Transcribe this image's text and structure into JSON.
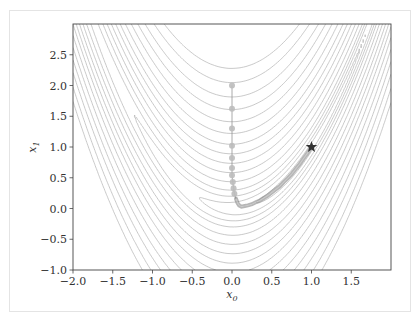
{
  "chart_data": {
    "type": "contour",
    "title": "",
    "function": "Rosenbrock f(x0,x1) = (1 - x0)^2 + 100 (x1 - x0^2)^2",
    "xlabel": "x0",
    "ylabel": "x1",
    "xlim": [
      -2.0,
      2.0
    ],
    "ylim": [
      -1.0,
      3.0
    ],
    "grid": false,
    "x_ticks": [
      "-2.0",
      "-1.5",
      "-1.0",
      "-0.5",
      "0.0",
      "0.5",
      "1.0",
      "1.5"
    ],
    "x_tick_values": [
      -2.0,
      -1.5,
      -1.0,
      -0.5,
      0.0,
      0.5,
      1.0,
      1.5
    ],
    "y_ticks": [
      "-1.0",
      "-0.5",
      "0.0",
      "0.5",
      "1.0",
      "1.5",
      "2.0",
      "2.5"
    ],
    "y_tick_values": [
      -1.0,
      -0.5,
      0.0,
      0.5,
      1.0,
      1.5,
      2.0,
      2.5
    ],
    "contour_levels": [
      0.5,
      2,
      5,
      10,
      20,
      35,
      55,
      80,
      110,
      150,
      200,
      260,
      330,
      420,
      520
    ],
    "optimization_path": {
      "start": [
        0.0,
        2.0
      ],
      "points": [
        [
          0.0,
          2.0
        ],
        [
          0.0,
          1.62
        ],
        [
          0.0,
          1.3
        ],
        [
          0.0,
          1.02
        ],
        [
          0.0,
          0.82
        ],
        [
          0.0,
          0.66
        ],
        [
          0.0,
          0.54
        ],
        [
          0.01,
          0.43
        ],
        [
          0.02,
          0.33
        ],
        [
          0.03,
          0.24
        ],
        [
          0.05,
          0.16
        ],
        [
          0.07,
          0.09
        ],
        [
          0.09,
          0.05
        ],
        [
          0.12,
          0.03
        ],
        [
          0.16,
          0.04
        ],
        [
          0.2,
          0.05
        ],
        [
          0.25,
          0.07
        ],
        [
          0.3,
          0.1
        ],
        [
          0.35,
          0.13
        ],
        [
          0.4,
          0.17
        ],
        [
          0.45,
          0.21
        ],
        [
          0.5,
          0.26
        ],
        [
          0.55,
          0.31
        ],
        [
          0.6,
          0.36
        ],
        [
          0.65,
          0.43
        ],
        [
          0.7,
          0.49
        ],
        [
          0.75,
          0.56
        ],
        [
          0.8,
          0.64
        ],
        [
          0.85,
          0.72
        ],
        [
          0.9,
          0.81
        ],
        [
          0.95,
          0.9
        ],
        [
          1.0,
          1.0
        ]
      ]
    },
    "minimum_marker": {
      "x": 1.0,
      "y": 1.0,
      "symbol": "star"
    },
    "colors": {
      "contour": "#b8b8b8",
      "path": "#8a8a8a",
      "marker": "#333333",
      "axes": "#444444"
    }
  },
  "labels": {
    "xlabel": "x",
    "xlabel_sub": "0",
    "ylabel": "x",
    "ylabel_sub": "1"
  }
}
